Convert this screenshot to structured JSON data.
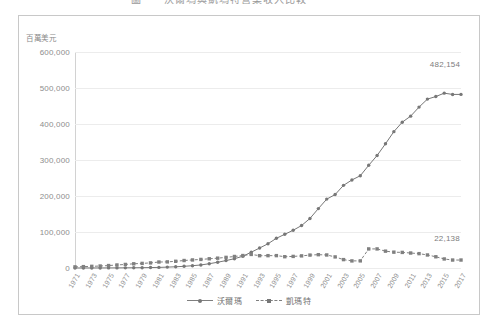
{
  "title_strip": {
    "text": "圖一　沃爾瑪與凱瑪特營業收入比較"
  },
  "chart_frame": {
    "unit_label": "百萬美元"
  },
  "legend": {
    "items": [
      {
        "label": "沃爾瑪",
        "marker": "round",
        "style": "solid",
        "color": "#777777"
      },
      {
        "label": "凱瑪特",
        "marker": "square",
        "style": "dashed",
        "color": "#808080"
      }
    ]
  },
  "annotations": [
    {
      "name": "walmart-end-label",
      "text": "482,154"
    },
    {
      "name": "kmart-end-label",
      "text": "22,138"
    }
  ],
  "chart_data": {
    "type": "line",
    "title": "圖一　沃爾瑪與凱瑪特營業收入比較",
    "xlabel": "",
    "ylabel": "百萬美元",
    "ylim": [
      0,
      600000
    ],
    "yticks": [
      0,
      100000,
      200000,
      300000,
      400000,
      500000,
      600000
    ],
    "ytick_labels": [
      "0",
      "100,000",
      "200,000",
      "300,000",
      "400,000",
      "500,000",
      "600,000"
    ],
    "grid": true,
    "legend_position": "bottom-center",
    "x": [
      1971,
      1972,
      1973,
      1974,
      1975,
      1976,
      1977,
      1978,
      1979,
      1980,
      1981,
      1982,
      1983,
      1984,
      1985,
      1986,
      1987,
      1988,
      1989,
      1990,
      1991,
      1992,
      1993,
      1994,
      1995,
      1996,
      1997,
      1998,
      1999,
      2000,
      2001,
      2002,
      2003,
      2004,
      2005,
      2006,
      2007,
      2008,
      2009,
      2010,
      2011,
      2012,
      2013,
      2014,
      2015,
      2016,
      2017
    ],
    "xtick_labels": [
      "1971",
      "1973",
      "1975",
      "1977",
      "1979",
      "1981",
      "1983",
      "1985",
      "1987",
      "1989",
      "1991",
      "1993",
      "1995",
      "1997",
      "1999",
      "2001",
      "2003",
      "2005",
      "2007",
      "2009",
      "2011",
      "2013",
      "2015",
      "2017"
    ],
    "series": [
      {
        "name": "沃爾瑪",
        "marker": "round",
        "style": "solid",
        "color": "#777777",
        "values": [
          44,
          78,
          125,
          168,
          236,
          340,
          479,
          678,
          900,
          1248,
          1643,
          2445,
          3376,
          4667,
          6401,
          8451,
          11909,
          15959,
          20649,
          25811,
          32602,
          43887,
          55484,
          67344,
          82494,
          93627,
          104859,
          117958,
          137634,
          165013,
          191329,
          204011,
          229616,
          244524,
          256329,
          285222,
          312427,
          344992,
          378799,
          405046,
          421849,
          446950,
          469162,
          476294,
          485651,
          482130,
          482154
        ],
        "end_label": "482,154"
      },
      {
        "name": "凱瑪特",
        "marker": "square",
        "style": "dashed",
        "color": "#808080",
        "values": [
          3100,
          3800,
          4600,
          5500,
          6800,
          8400,
          9900,
          11700,
          12800,
          14200,
          16600,
          17000,
          18600,
          20800,
          22400,
          23800,
          25600,
          27300,
          29500,
          32000,
          34600,
          37700,
          34200,
          34300,
          34400,
          31400,
          32200,
          33700,
          35900,
          37000,
          36200,
          30800,
          23300,
          19700,
          19800,
          53000,
          53000,
          46800,
          44000,
          43300,
          41600,
          39900,
          36200,
          31200,
          25100,
          22100,
          22138
        ],
        "end_label": "22,138"
      }
    ]
  }
}
